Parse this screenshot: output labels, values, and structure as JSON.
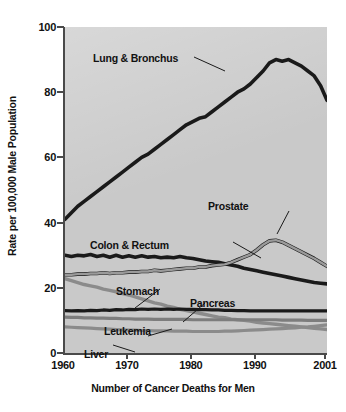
{
  "chart": {
    "xlabel": "Number of Cancer Deaths for Men",
    "ylabel": "Rate per 100,000 Male Population",
    "yticks": [
      "0",
      "20",
      "40",
      "60",
      "80",
      "100"
    ],
    "xticks": [
      "1960",
      "1970",
      "1980",
      "1990",
      "2001"
    ]
  },
  "annotations": {
    "lung": "Lung & Bronchus",
    "colon": "Colon & Rectum",
    "prostate": "Prostate",
    "stomach": "Stomach",
    "pancreas": "Pancreas",
    "leukemia": "Leukemia",
    "liver": "Liver"
  },
  "chart_data": {
    "type": "line",
    "title": "",
    "xlabel": "Number of Cancer Deaths for Men",
    "ylabel": "Rate per 100,000 Male Population",
    "xlim": [
      1960,
      2001
    ],
    "ylim": [
      0,
      100
    ],
    "ytick_values": [
      0,
      20,
      40,
      60,
      80,
      100
    ],
    "xtick_values": [
      1960,
      1970,
      1980,
      1990,
      2001
    ],
    "grid": false,
    "legend": "inline-annotations",
    "background_color": "#c9c9c9",
    "x": [
      1960,
      1961,
      1962,
      1963,
      1964,
      1965,
      1966,
      1967,
      1968,
      1969,
      1970,
      1971,
      1972,
      1973,
      1974,
      1975,
      1976,
      1977,
      1978,
      1979,
      1980,
      1981,
      1982,
      1983,
      1984,
      1985,
      1986,
      1987,
      1988,
      1989,
      1990,
      1991,
      1992,
      1993,
      1994,
      1995,
      1996,
      1997,
      1998,
      1999,
      2000,
      2001
    ],
    "series": [
      {
        "name": "Lung & Bronchus",
        "color": "#1a1a1a",
        "width": 3.6,
        "values": [
          41,
          43,
          45,
          46.5,
          48,
          49.5,
          51,
          52.5,
          54,
          55.5,
          57,
          58.5,
          60,
          61,
          62.5,
          64,
          65.5,
          67,
          68.5,
          70,
          71,
          72,
          72.5,
          74,
          75.5,
          77,
          78.5,
          80,
          81,
          82.5,
          84.5,
          86.5,
          89,
          90,
          89.5,
          90,
          89,
          88,
          86.5,
          85,
          82,
          77.5
        ]
      },
      {
        "name": "Colon & Rectum",
        "color": "#1a1a1a",
        "width": 3.6,
        "values": [
          30,
          29.6,
          30,
          29.8,
          30.2,
          29.6,
          30,
          29.4,
          30,
          29.4,
          29.8,
          29.4,
          29.8,
          29.4,
          29.6,
          29.2,
          29.4,
          29.2,
          29.6,
          29.2,
          29,
          28.6,
          28.2,
          28,
          27.8,
          27.4,
          27,
          26.6,
          26,
          25.6,
          25.2,
          24.8,
          24.4,
          24,
          23.6,
          23.2,
          22.8,
          22.4,
          22,
          21.6,
          21.4,
          21.2
        ]
      },
      {
        "name": "Prostate",
        "color": "#1a1a1a",
        "width": 3.6,
        "values": [
          null,
          null,
          null,
          null,
          null,
          null,
          null,
          null,
          null,
          null,
          null,
          null,
          null,
          null,
          null,
          null,
          null,
          null,
          null,
          null,
          null,
          null,
          null,
          null,
          null,
          null,
          null,
          null,
          null,
          null,
          null,
          null,
          null,
          null,
          null,
          null,
          null,
          null,
          null,
          null,
          null,
          null
        ]
      },
      {
        "name": "Prostate-dark",
        "color": "#1a1a1a",
        "width": 3.6,
        "values": [
          24,
          24,
          24.2,
          24.2,
          24.4,
          24.4,
          24.6,
          24.4,
          24.6,
          24.6,
          24.8,
          24.8,
          25,
          25,
          25.4,
          25.2,
          25.4,
          25.6,
          25.8,
          26,
          26,
          26.4,
          26.4,
          26.8,
          27,
          27.2,
          27.8,
          28.6,
          29.4,
          30.2,
          31.6,
          33.2,
          34.4,
          34.6,
          34,
          33,
          32,
          31,
          30,
          29,
          27.8,
          26.6
        ]
      },
      {
        "name": "Prostate-light",
        "color": "#9a9a9a",
        "width": 2.4,
        "values": [
          24,
          24,
          24.2,
          24.2,
          24.4,
          24.4,
          24.6,
          24.4,
          24.6,
          24.6,
          24.8,
          24.8,
          25,
          25,
          25.4,
          25.2,
          25.4,
          25.6,
          25.8,
          26,
          26,
          26.4,
          26.4,
          26.8,
          27,
          27.2,
          27.8,
          28.6,
          29.4,
          30.2,
          31.6,
          33.2,
          34.4,
          34.6,
          34,
          33,
          32,
          31,
          30,
          29,
          27.8,
          26.6
        ]
      },
      {
        "name": "Stomach",
        "color": "#8b8b8b",
        "width": 3.4,
        "values": [
          22.8,
          22.2,
          21.6,
          21,
          20.6,
          20.2,
          19.6,
          19.2,
          18.8,
          18.2,
          17.8,
          17.2,
          16.6,
          16,
          15.4,
          15,
          14.4,
          14,
          13.4,
          13,
          12.6,
          12.2,
          11.8,
          11.4,
          11,
          10.8,
          10.4,
          10.2,
          10,
          9.8,
          9.4,
          9.2,
          9,
          8.8,
          8.6,
          8.4,
          8.2,
          8,
          7.8,
          7.6,
          7.4,
          7.2
        ]
      },
      {
        "name": "Pancreas",
        "color": "#1a1a1a",
        "width": 3.2,
        "values": [
          13,
          12.9,
          13,
          12.9,
          13.1,
          13,
          13.2,
          13.1,
          13.3,
          13.2,
          13.4,
          13.3,
          13.5,
          13.4,
          13.5,
          13.4,
          13.5,
          13.4,
          13.5,
          13.4,
          13.4,
          13.3,
          13.3,
          13.2,
          13.2,
          13.1,
          13.1,
          13,
          13,
          12.9,
          12.9,
          12.9,
          12.9,
          12.9,
          12.9,
          12.9,
          12.9,
          12.9,
          12.9,
          12.9,
          12.9,
          12.9
        ]
      },
      {
        "name": "Leukemia",
        "color": "#7d7d7d",
        "width": 3.2,
        "values": [
          11,
          10.9,
          10.9,
          10.8,
          10.8,
          10.7,
          10.7,
          10.6,
          10.6,
          10.5,
          10.5,
          10.4,
          10.4,
          10.4,
          10.3,
          10.3,
          10.3,
          10.3,
          10.3,
          10.3,
          10.2,
          10.2,
          10.2,
          10.2,
          10.2,
          10.2,
          10.2,
          10.2,
          10.2,
          10.2,
          10.2,
          10.2,
          10.2,
          10.2,
          10.1,
          10.1,
          10.1,
          10.1,
          10,
          10,
          10,
          10
        ]
      },
      {
        "name": "Liver",
        "color": "#8b8b8b",
        "width": 3.2,
        "values": [
          8,
          7.9,
          7.8,
          7.7,
          7.6,
          7.5,
          7.4,
          7.3,
          7.2,
          7.1,
          7,
          7,
          6.9,
          6.9,
          6.8,
          6.8,
          6.8,
          6.7,
          6.7,
          6.7,
          6.6,
          6.6,
          6.6,
          6.6,
          6.6,
          6.7,
          6.7,
          6.8,
          6.9,
          7,
          7.1,
          7.2,
          7.3,
          7.4,
          7.5,
          7.6,
          7.7,
          7.9,
          8,
          8.2,
          8.4,
          8.6
        ]
      }
    ]
  }
}
